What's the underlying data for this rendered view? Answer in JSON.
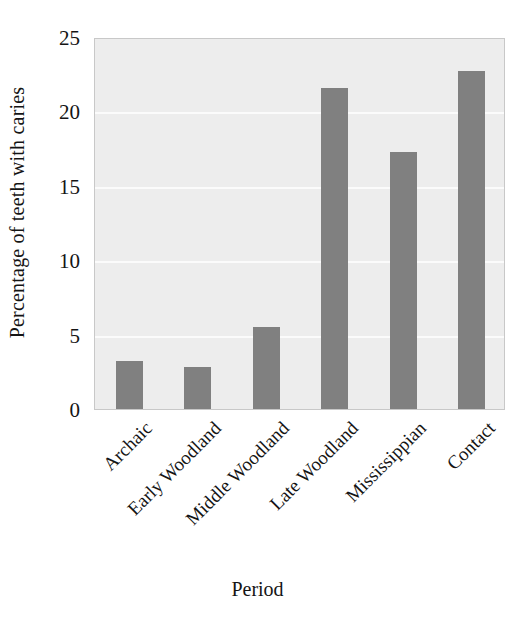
{
  "chart_data": {
    "type": "bar",
    "title": "",
    "xlabel": "Period",
    "ylabel": "Percentage of teeth with caries",
    "categories": [
      "Archaic",
      "Early Woodland",
      "Middle Woodland",
      "Late Woodland",
      "Mississippian",
      "Contact"
    ],
    "values": [
      3.2,
      2.8,
      5.5,
      21.6,
      17.3,
      22.7
    ],
    "ylim": [
      0,
      25
    ],
    "yticks": [
      0,
      5,
      10,
      15,
      20,
      25
    ],
    "ytick_labels": [
      "0",
      "5",
      "10",
      "15",
      "20",
      "25"
    ],
    "grid": true,
    "grid_orientation": "horizontal",
    "legend": false,
    "legend_position": "none",
    "bar_color": "#808080",
    "plot_background": "#ededed",
    "gridline_color": "#fbfbfb",
    "axis_border_color": "#c8c8c8",
    "text_color": "#141414"
  }
}
